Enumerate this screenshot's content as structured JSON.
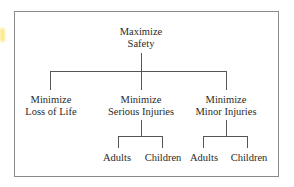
{
  "diagram": {
    "type": "hierarchy-tree",
    "root": {
      "line1": "Maximize",
      "line2": "Safety"
    },
    "level1": [
      {
        "line1": "Minimize",
        "line2": "Loss of Life"
      },
      {
        "line1": "Minimize",
        "line2": "Serious Injuries"
      },
      {
        "line1": "Minimize",
        "line2": "Minor Injuries"
      }
    ],
    "level2": {
      "serious_injuries": [
        "Adults",
        "Children"
      ],
      "minor_injuries": [
        "Adults",
        "Children"
      ]
    }
  }
}
